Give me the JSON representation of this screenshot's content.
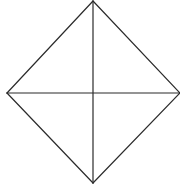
{
  "canvas": {
    "width": 180,
    "height": 184,
    "background": "#ffffff"
  },
  "diagram": {
    "shape": "rhombus-with-diagonals",
    "stroke_color": "#2b2b2b",
    "stroke_width": 1.2,
    "vertices": {
      "top": [
        93,
        1
      ],
      "right": [
        180,
        93
      ],
      "bottom": [
        93,
        183
      ],
      "left": [
        7,
        93
      ]
    },
    "center": [
      93,
      93
    ],
    "edges": [
      {
        "name": "edge-top-right",
        "from": "top",
        "to": "right"
      },
      {
        "name": "edge-right-bottom",
        "from": "right",
        "to": "bottom"
      },
      {
        "name": "edge-bottom-left",
        "from": "bottom",
        "to": "left"
      },
      {
        "name": "edge-left-top",
        "from": "left",
        "to": "top"
      }
    ],
    "diagonals": [
      {
        "name": "vertical-diagonal",
        "from": "top",
        "to": "bottom"
      },
      {
        "name": "horizontal-diagonal",
        "from": "left",
        "to": "right"
      }
    ]
  }
}
